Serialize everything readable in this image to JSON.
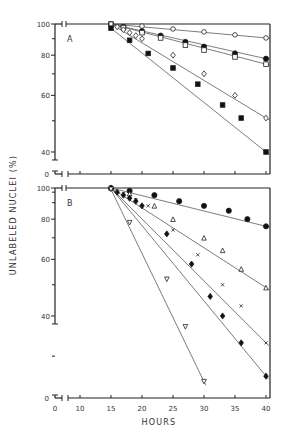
{
  "chart_data": [
    {
      "panel": "A",
      "type": "line",
      "ylabel": "UNLABELED NUCLEI (%)",
      "xlabel": "HOURS",
      "yscale": "log",
      "ylim": [
        0,
        100
      ],
      "yticks": [
        "100",
        "80",
        "60",
        "40",
        "0"
      ],
      "xticks": [
        "0",
        "10",
        "15",
        "20",
        "25",
        "30",
        "35",
        "40"
      ],
      "grid": false,
      "series": [
        {
          "name": "open-circle",
          "marker": "circle-open",
          "x": [
            15,
            20,
            25,
            30,
            35,
            40
          ],
          "y": [
            100,
            98.5,
            96.5,
            94.5,
            92.5,
            90.5
          ]
        },
        {
          "name": "filled-circle",
          "marker": "circle-filled",
          "x": [
            15,
            17,
            20,
            23,
            27,
            30,
            35,
            40
          ],
          "y": [
            100,
            98,
            95,
            92,
            88,
            85,
            81,
            78
          ]
        },
        {
          "name": "open-square",
          "marker": "square-open",
          "x": [
            15,
            17,
            20,
            23,
            27,
            30,
            35,
            40
          ],
          "y": [
            100,
            97.5,
            94,
            90.5,
            86,
            83,
            79,
            75
          ]
        },
        {
          "name": "open-diamond",
          "marker": "diamond-open",
          "x": [
            15,
            16,
            17,
            18,
            19,
            20,
            25,
            30,
            35,
            40
          ],
          "y": [
            100,
            98,
            96,
            94,
            92,
            90,
            80,
            70,
            60,
            51
          ]
        },
        {
          "name": "filled-square",
          "marker": "square-filled",
          "x": [
            15,
            18,
            21,
            25,
            29,
            33,
            36,
            40
          ],
          "y": [
            97,
            89,
            81,
            73,
            65,
            56,
            51,
            40
          ]
        }
      ]
    },
    {
      "panel": "B",
      "type": "line",
      "ylabel": "UNLABELED NUCLEI (%)",
      "xlabel": "HOURS",
      "yscale": "log",
      "ylim": [
        0,
        100
      ],
      "yticks": [
        "100",
        "80",
        "60",
        "40",
        "0"
      ],
      "xticks": [
        "0",
        "10",
        "15",
        "20",
        "25",
        "30",
        "35",
        "40"
      ],
      "grid": false,
      "series": [
        {
          "name": "filled-circle",
          "marker": "circle-filled",
          "x": [
            15,
            18,
            22,
            26,
            30,
            34,
            37,
            40
          ],
          "y": [
            100,
            98,
            95,
            91,
            88,
            85,
            80,
            76
          ]
        },
        {
          "name": "open-triangle",
          "marker": "triangle-open",
          "x": [
            15,
            18,
            22,
            25,
            30,
            33,
            36,
            40
          ],
          "y": [
            100,
            96,
            88,
            80,
            70,
            64,
            56,
            49
          ]
        },
        {
          "name": "cross",
          "marker": "x",
          "x": [
            15,
            17,
            19,
            21,
            25,
            29,
            33,
            36,
            40
          ],
          "y": [
            100,
            96,
            92,
            88,
            74,
            62,
            50,
            43,
            33
          ]
        },
        {
          "name": "filled-diamond",
          "marker": "diamond-filled",
          "x": [
            15,
            16,
            17,
            18,
            19,
            20,
            24,
            28,
            31,
            33,
            36,
            40
          ],
          "y": [
            100,
            97,
            95,
            93,
            91,
            88,
            72,
            58,
            46,
            40,
            33,
            26
          ]
        },
        {
          "name": "open-inverted-triangle",
          "marker": "triangle-down-open",
          "x": [
            15,
            18,
            24,
            27,
            30
          ],
          "y": [
            99,
            78,
            52,
            37,
            25
          ]
        }
      ]
    }
  ],
  "labels": {
    "panel_a": "A",
    "panel_b": "B",
    "ylabel": "UNLABELED NUCLEI (%)",
    "xlabel": "HOURS"
  }
}
